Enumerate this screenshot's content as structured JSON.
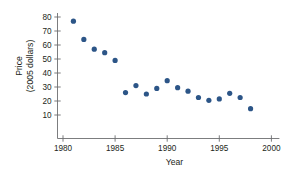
{
  "chart_data": {
    "type": "scatter",
    "title": "",
    "xlabel": "Year",
    "ylabel": "Price (2005 dollars)",
    "ylabel_line1": "Price",
    "ylabel_line2": "(2005 dollars)",
    "xlim": [
      1980,
      2000
    ],
    "ylim": [
      5,
      85
    ],
    "xticks": [
      1980,
      1985,
      1990,
      1995,
      2000
    ],
    "xtick_labels": [
      "1980",
      "1985",
      "1990",
      "1995",
      "2000"
    ],
    "yticks": [
      10,
      20,
      30,
      40,
      50,
      60,
      70,
      80
    ],
    "ytick_labels": [
      "10",
      "20",
      "30",
      "40",
      "50",
      "60",
      "70",
      "80"
    ],
    "grid": false,
    "legend": null,
    "marker_color": "#2c5587",
    "axis_color": "#6d6e71",
    "text_color": "#231f20",
    "x": [
      1981,
      1982,
      1983,
      1984,
      1985,
      1986,
      1987,
      1988,
      1989,
      1990,
      1991,
      1992,
      1993,
      1994,
      1995,
      1996,
      1997,
      1998
    ],
    "values": [
      77,
      64,
      57,
      54.5,
      49,
      26,
      31,
      25,
      29,
      34.5,
      29.5,
      27,
      22.5,
      20.5,
      21.5,
      25.5,
      22.5,
      14.5
    ],
    "points": [
      {
        "year": 1981,
        "price": 77
      },
      {
        "year": 1982,
        "price": 64
      },
      {
        "year": 1983,
        "price": 57
      },
      {
        "year": 1984,
        "price": 54.5
      },
      {
        "year": 1985,
        "price": 49
      },
      {
        "year": 1986,
        "price": 26
      },
      {
        "year": 1987,
        "price": 31
      },
      {
        "year": 1988,
        "price": 25
      },
      {
        "year": 1989,
        "price": 29
      },
      {
        "year": 1990,
        "price": 34.5
      },
      {
        "year": 1991,
        "price": 29.5
      },
      {
        "year": 1992,
        "price": 27
      },
      {
        "year": 1993,
        "price": 22.5
      },
      {
        "year": 1994,
        "price": 20.5
      },
      {
        "year": 1995,
        "price": 21.5
      },
      {
        "year": 1996,
        "price": 25.5
      },
      {
        "year": 1997,
        "price": 22.5
      },
      {
        "year": 1998,
        "price": 14.5
      }
    ]
  }
}
